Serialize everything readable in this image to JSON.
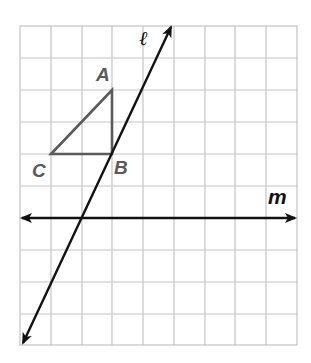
{
  "figure": {
    "type": "coordinate-grid-diagram",
    "grid": {
      "columns": 9,
      "rows": 10,
      "line_color": "#c4c4c4"
    },
    "triangle": {
      "color": "#5a5a5a",
      "vertices": [
        {
          "name": "A",
          "label": "A"
        },
        {
          "name": "B",
          "label": "B"
        },
        {
          "name": "C",
          "label": "C"
        }
      ]
    },
    "lines": [
      {
        "name": "l",
        "label": "ℓ",
        "color": "#111111",
        "description": "slanted line through B"
      },
      {
        "name": "m",
        "label": "m",
        "color": "#111111",
        "description": "horizontal line"
      }
    ]
  }
}
